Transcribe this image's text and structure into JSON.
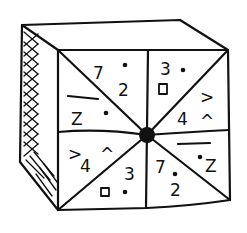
{
  "figure": {
    "ink_color": "#111111",
    "background_color": "#ffffff"
  },
  "sectors": [
    {
      "id": "top-left-upper",
      "symbols": {
        "a": "7",
        "b": "2",
        "dot": "•"
      }
    },
    {
      "id": "top-left-lower",
      "symbols": {
        "a": "Z",
        "dot": "•"
      }
    },
    {
      "id": "top-right-upper",
      "symbols": {
        "a": "3",
        "b": "□",
        "dot": "•"
      }
    },
    {
      "id": "top-right-lower",
      "symbols": {
        "a": ">",
        "b": "4",
        "c": "^"
      }
    },
    {
      "id": "bottom-left-upper",
      "symbols": {
        "a": ">",
        "b": "4",
        "c": "^"
      }
    },
    {
      "id": "bottom-left-lower",
      "symbols": {
        "a": "3",
        "b": "□",
        "dot": "•"
      }
    },
    {
      "id": "bottom-right-upper",
      "symbols": {
        "a": "Z",
        "dot": "•"
      }
    },
    {
      "id": "bottom-right-lower",
      "symbols": {
        "a": "7",
        "b": "2",
        "dot": "•"
      }
    }
  ]
}
